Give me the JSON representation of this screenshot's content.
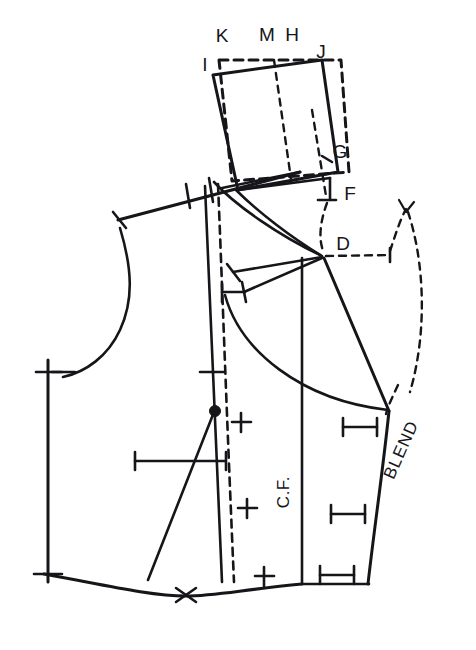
{
  "diagram": {
    "type": "sewing-pattern-technical-drawing",
    "canvas": {
      "width": 476,
      "height": 650
    },
    "ink_color": "#16161a",
    "background_color": "#ffffff",
    "point_labels": [
      {
        "id": "K",
        "text": "K",
        "x": 222,
        "y": 42
      },
      {
        "id": "M",
        "text": "M",
        "x": 267,
        "y": 41
      },
      {
        "id": "H",
        "text": "H",
        "x": 292,
        "y": 41
      },
      {
        "id": "J",
        "text": "J",
        "x": 321,
        "y": 58
      },
      {
        "id": "I",
        "text": "I",
        "x": 205,
        "y": 71
      },
      {
        "id": "G",
        "text": "G",
        "x": 334,
        "y": 158
      },
      {
        "id": "F",
        "text": "F",
        "x": 344,
        "y": 200
      },
      {
        "id": "D",
        "text": "D",
        "x": 337,
        "y": 243
      }
    ],
    "annotations": [
      {
        "id": "center-front",
        "text": "C.F.",
        "x": 289,
        "y": 492,
        "rotation": -90
      },
      {
        "id": "blend",
        "text": "BLEND",
        "x": 406,
        "y": 452,
        "rotation": -66
      }
    ],
    "marks": {
      "plus_marks": [
        {
          "x": 241,
          "y": 422
        },
        {
          "x": 247,
          "y": 508
        },
        {
          "x": 264,
          "y": 576
        }
      ],
      "ibar_marks": [
        {
          "x": 360,
          "y": 427,
          "width": 34
        },
        {
          "x": 348,
          "y": 514,
          "width": 34
        },
        {
          "x": 337,
          "y": 575,
          "width": 34
        }
      ],
      "bust_point": {
        "x": 215,
        "y": 411
      },
      "cross_mark_hem": {
        "x": 186,
        "y": 595
      }
    }
  }
}
